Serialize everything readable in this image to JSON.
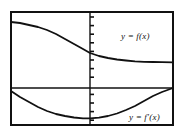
{
  "figure": {
    "name": "graph-of-function-and-derivative",
    "background_color": "#ffffff",
    "ink_color": "#111111",
    "frame": {
      "name": "plot-frame",
      "x": 10,
      "y": 11,
      "width": 164,
      "height": 115,
      "stroke_width": 2
    },
    "labels": {
      "function_label": "y = f(x)",
      "derivative_label": "y = f′(x)"
    }
  },
  "chart_data": {
    "type": "line",
    "title": "",
    "xlabel": "",
    "ylabel": "",
    "grid": false,
    "legend": "inline-annotations",
    "axes": {
      "x_axis": {
        "name": "horizontal-axis",
        "orientation": "horizontal",
        "pixel_y": 88,
        "from_x": 11,
        "to_x": 173,
        "ticks": []
      },
      "y_axis": {
        "name": "vertical-axis",
        "orientation": "vertical",
        "pixel_x": 90,
        "from_y": 12,
        "to_y": 125,
        "tick_count": 13,
        "tick_spacing_px": 8.6,
        "tick_length_px": 4,
        "tick_side": "right"
      }
    },
    "series": [
      {
        "name": "y = f(x)",
        "label": "y = f(x)",
        "style": "solid",
        "color": "#111111",
        "description": "decreasing curve, concave down then concave up, flattening to the right",
        "points": [
          [
            11,
            22
          ],
          [
            20,
            23
          ],
          [
            29,
            25
          ],
          [
            38,
            27
          ],
          [
            47,
            30
          ],
          [
            56,
            34
          ],
          [
            65,
            39
          ],
          [
            74,
            44
          ],
          [
            83,
            49
          ],
          [
            90,
            53
          ],
          [
            99,
            56
          ],
          [
            108,
            58
          ],
          [
            117,
            59.5
          ],
          [
            126,
            60.5
          ],
          [
            135,
            61.3
          ],
          [
            144,
            61.8
          ],
          [
            153,
            62
          ],
          [
            162,
            62.2
          ],
          [
            173,
            62.3
          ]
        ]
      },
      {
        "name": "y = f'(x)",
        "label": "y = f′(x)",
        "style": "solid",
        "color": "#111111",
        "description": "upward-opening curve below the x-axis with minimum near x = 88",
        "points": [
          [
            11,
            91
          ],
          [
            20,
            97
          ],
          [
            29,
            102
          ],
          [
            38,
            107
          ],
          [
            47,
            111
          ],
          [
            56,
            114
          ],
          [
            65,
            116
          ],
          [
            74,
            117.5
          ],
          [
            83,
            118.3
          ],
          [
            90,
            118.4
          ],
          [
            99,
            117.6
          ],
          [
            108,
            116
          ],
          [
            117,
            113.5
          ],
          [
            126,
            110
          ],
          [
            135,
            106
          ],
          [
            144,
            101
          ],
          [
            153,
            96
          ],
          [
            162,
            92
          ],
          [
            173,
            88
          ]
        ]
      }
    ]
  }
}
